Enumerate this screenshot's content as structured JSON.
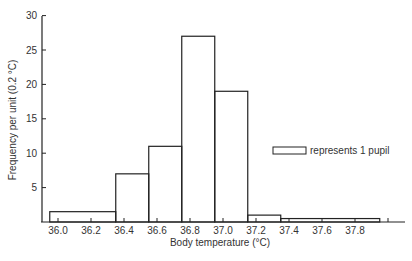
{
  "chart_data": {
    "type": "bar",
    "subtype": "histogram",
    "title": "",
    "xlabel": "Body temperature (°C)",
    "ylabel": "Frequency per unit (0.2 °C)",
    "ylim": [
      0,
      30
    ],
    "xlim": [
      35.9,
      38.1
    ],
    "grid": false,
    "y_ticks": [
      5,
      10,
      15,
      20,
      25,
      30
    ],
    "x_ticks": [
      "36.0",
      "36.2",
      "36.4",
      "36.6",
      "36.8",
      "37.0",
      "37.2",
      "37.4",
      "37.6",
      "37.8"
    ],
    "bins": [
      {
        "start": 35.95,
        "end": 36.35,
        "density": 1.5,
        "label": "36.0–36.3"
      },
      {
        "start": 36.35,
        "end": 36.55,
        "density": 7,
        "label": "36.4–36.5"
      },
      {
        "start": 36.55,
        "end": 36.75,
        "density": 11,
        "label": "36.6–36.7"
      },
      {
        "start": 36.75,
        "end": 36.95,
        "density": 27,
        "label": "36.8–36.9"
      },
      {
        "start": 36.95,
        "end": 37.15,
        "density": 19,
        "label": "37.0–37.1"
      },
      {
        "start": 37.15,
        "end": 37.35,
        "density": 1,
        "label": "37.2–37.3"
      },
      {
        "start": 37.35,
        "end": 37.95,
        "density": 0.5,
        "label": "37.4–37.9"
      }
    ],
    "categories": [
      "35.95–36.35",
      "36.35–36.55",
      "36.55–36.75",
      "36.75–36.95",
      "36.95–37.15",
      "37.15–37.35",
      "37.35–37.95"
    ],
    "values": [
      1.5,
      7,
      11,
      27,
      19,
      1,
      0.5
    ],
    "legend": {
      "position": "right-middle",
      "entries": [
        {
          "symbol": "rectangle",
          "text": "represents 1 pupil"
        }
      ]
    }
  },
  "axis": {
    "x_title": "Body temperature (°C)",
    "y_title": "Frequency per unit (0.2 °C)",
    "y_tick_labels": [
      "5",
      "10",
      "15",
      "20",
      "25",
      "30"
    ],
    "x_tick_labels": [
      "36.0",
      "36.2",
      "36.4",
      "36.6",
      "36.8",
      "37.0",
      "37.2",
      "37.4",
      "37.6",
      "37.8"
    ]
  },
  "legend": {
    "text": "represents 1 pupil"
  },
  "colors": {
    "ink": "#222222",
    "background": "#ffffff"
  }
}
